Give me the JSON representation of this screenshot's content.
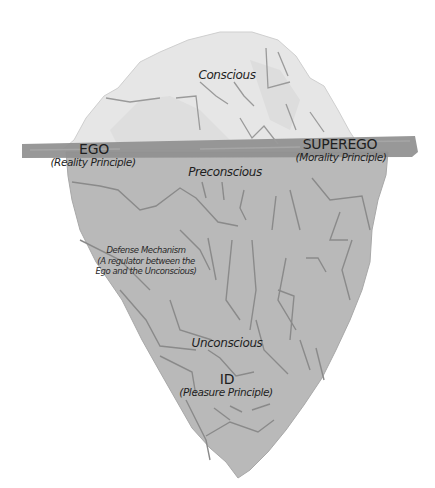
{
  "diagram": {
    "type": "iceberg",
    "colors": {
      "above_water": "#e6e6e6",
      "below_water": "#b9b9b9",
      "waterline": "#8f8f8f",
      "crack_lines": "#8a8a8a",
      "text": "#1e1e1e"
    },
    "labels": {
      "conscious": "Conscious",
      "ego": "EGO",
      "ego_sub": "(Reality Principle)",
      "superego": "SUPEREGO",
      "superego_sub": "(Morality Principle)",
      "preconscious": "Preconscious",
      "defense_line1": "Defense Mechanism",
      "defense_line2": "(A regulator between the",
      "defense_line3": "Ego and the Unconscious)",
      "unconscious": "Unconscious",
      "id": "ID",
      "id_sub": "(Pleasure Principle)"
    }
  }
}
